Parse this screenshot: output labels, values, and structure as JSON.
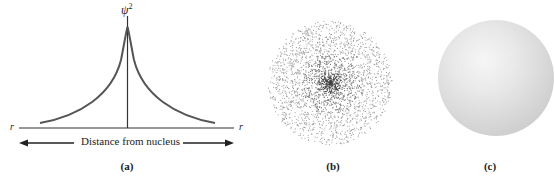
{
  "figure": {
    "panels": [
      {
        "id": "a",
        "caption": "(a)",
        "y_axis_label": "ψ",
        "y_axis_exponent": "2",
        "x_axis_left_label": "r",
        "x_axis_right_label": "r",
        "x_axis_title": "Distance from nucleus",
        "description": "Probability density ψ² vs distance from nucleus, peaked at center, decaying symmetrically"
      },
      {
        "id": "b",
        "caption": "(b)",
        "description": "Electron density dot cloud, dense at center"
      },
      {
        "id": "c",
        "caption": "(c)",
        "description": "Shaded sphere boundary surface"
      }
    ]
  },
  "chart_data": {
    "type": "line",
    "title": "",
    "xlabel": "Distance from nucleus",
    "ylabel": "ψ²",
    "x": [
      -1.0,
      -0.8,
      -0.6,
      -0.4,
      -0.2,
      -0.1,
      0,
      0.1,
      0.2,
      0.4,
      0.6,
      0.8,
      1.0
    ],
    "series": [
      {
        "name": "ψ²",
        "values": [
          0.05,
          0.09,
          0.15,
          0.25,
          0.45,
          0.65,
          1.0,
          0.65,
          0.45,
          0.25,
          0.15,
          0.09,
          0.05
        ]
      }
    ],
    "grid": false,
    "legend": "none"
  }
}
